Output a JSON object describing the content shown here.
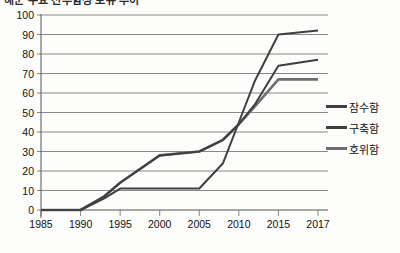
{
  "title": {
    "text": "해군 주요 전투함정 보유 추이",
    "cropped": true
  },
  "legend": {
    "position": "right",
    "entries": [
      {
        "label": "잠수함",
        "color": "#404040"
      },
      {
        "label": "구축함",
        "color": "#3f3f3f"
      },
      {
        "label": "호위함",
        "color": "#6e6e6e"
      }
    ]
  },
  "axes": {
    "y_ticks": [
      "0",
      "10",
      "20",
      "30",
      "40",
      "50",
      "60",
      "70",
      "80",
      "90",
      "100"
    ],
    "x_ticks": [
      "1985",
      "1990",
      "1995",
      "2000",
      "2005",
      "2010",
      "2015",
      "2017"
    ]
  },
  "chart_data": {
    "type": "line",
    "title": "해군 주요 전투함정 보유 추이",
    "xlabel": "",
    "ylabel": "",
    "xlim": [
      1985,
      2017
    ],
    "ylim": [
      0,
      100
    ],
    "ytick_step": 10,
    "grid": true,
    "grid_orientation": "horizontal",
    "legend_position": "right",
    "x": [
      1985,
      1990,
      1993,
      1995,
      2000,
      2005,
      2008,
      2010,
      2012,
      2015,
      2017
    ],
    "series": [
      {
        "name": "잠수함",
        "color": "#404040",
        "values": [
          0,
          0,
          6,
          11,
          11,
          11,
          24,
          45,
          66,
          90,
          92
        ]
      },
      {
        "name": "구축함",
        "color": "#3f3f3f",
        "values": [
          0,
          0,
          7,
          14,
          28,
          30,
          36,
          44,
          54,
          74,
          77
        ]
      },
      {
        "name": "호위함",
        "color": "#6e6e6e",
        "values": [
          0,
          0,
          7,
          14,
          28,
          30,
          36,
          44,
          53,
          67,
          67
        ]
      }
    ]
  }
}
